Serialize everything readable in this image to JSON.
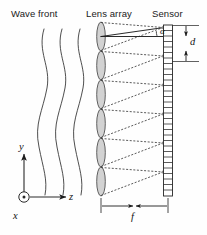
{
  "figure": {
    "kind": "optics-schematic",
    "width": 207,
    "height": 235,
    "background": "#ffffff",
    "ink": "#1a1a1a"
  },
  "labels": {
    "wave_front": "Wave front",
    "lens_array": "Lens array",
    "sensor": "Sensor"
  },
  "annotations": {
    "pitch": "d",
    "focal_length": "f",
    "angle": "α"
  },
  "axes": {
    "y": "y",
    "z": "z",
    "x": "x",
    "x_symbol": "circle-dot-out-of-page"
  },
  "wave_fronts": {
    "count": 3,
    "stroke": "#3a3a3a",
    "stroke_width": 0.9,
    "x_positions": [
      42,
      60,
      78
    ],
    "y_top": 28,
    "y_bottom": 196,
    "amplitude": 7
  },
  "lens_array": {
    "count": 6,
    "x_center": 101,
    "y_top": 22,
    "y_bottom": 196,
    "lens_half_width": 4.2,
    "fill": "#d2d2d2",
    "stroke": "#4a4a4a",
    "stroke_width": 0.9
  },
  "sensor": {
    "x_left": 163.5,
    "x_right": 172.5,
    "y_top": 25,
    "y_bottom": 196,
    "cell_count": 31,
    "stroke": "#2a2a2a",
    "stroke_width": 0.8,
    "fill": "#ffffff"
  },
  "rays": {
    "style_cone": "dashed",
    "style_axis": "solid",
    "dash_pattern": "2,1.6",
    "stroke": "#3c3c3c",
    "stroke_width": 0.85,
    "spot_fill": "#8c8c8c"
  },
  "dimensions": {
    "d": {
      "x": 186,
      "y_top": 25,
      "y_bottom": 62
    },
    "f": {
      "y": 206,
      "x_left": 101,
      "x_right": 168
    }
  }
}
